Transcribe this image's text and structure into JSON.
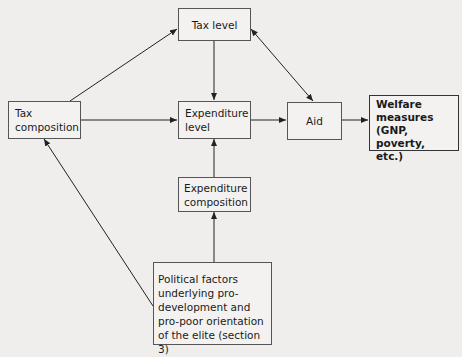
{
  "diagram": {
    "nodes": [
      {
        "id": "tax_level",
        "label": "Tax level"
      },
      {
        "id": "tax_composition",
        "label": "Tax composition"
      },
      {
        "id": "expenditure_level",
        "label": "Expenditure level"
      },
      {
        "id": "aid",
        "label": "Aid"
      },
      {
        "id": "welfare",
        "label": "Welfare measures (GNP, poverty, etc.)"
      },
      {
        "id": "expenditure_composition",
        "label": "Expenditure composition"
      },
      {
        "id": "political_factors",
        "label": "Political factors underlying pro-development and pro-poor orientation of the elite (section 3)"
      }
    ],
    "edges": [
      {
        "from": "tax_composition",
        "to": "tax_level",
        "type": "directed"
      },
      {
        "from": "tax_composition",
        "to": "expenditure_level",
        "type": "directed"
      },
      {
        "from": "tax_level",
        "to": "expenditure_level",
        "type": "directed"
      },
      {
        "from": "tax_level",
        "to": "aid",
        "type": "bidirectional"
      },
      {
        "from": "expenditure_level",
        "to": "aid",
        "type": "directed"
      },
      {
        "from": "aid",
        "to": "welfare",
        "type": "directed"
      },
      {
        "from": "expenditure_composition",
        "to": "expenditure_level",
        "type": "directed"
      },
      {
        "from": "political_factors",
        "to": "expenditure_composition",
        "type": "directed"
      },
      {
        "from": "political_factors",
        "to": "tax_composition",
        "type": "directed"
      }
    ]
  },
  "labels": {
    "tax_level": "Tax level",
    "tax_composition": [
      "Tax",
      "composition"
    ],
    "expenditure_level": [
      "Expenditure",
      "level"
    ],
    "aid": "Aid",
    "welfare": [
      "Welfare",
      "measures",
      "(GNP, poverty,",
      "etc.)"
    ],
    "expenditure_composition": [
      "Expenditure",
      "composition"
    ],
    "political_factors": [
      "Political factors",
      "underlying pro-",
      "development and",
      "pro-poor orientation",
      "of the elite (section 3)"
    ]
  }
}
